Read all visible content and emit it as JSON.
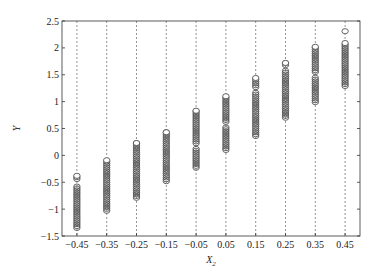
{
  "chart_data": {
    "type": "scatter",
    "title": "",
    "xlabel": "X",
    "xlabel_subscript": "2",
    "ylabel": "Y",
    "xlim": [
      -0.5,
      0.5
    ],
    "ylim": [
      -1.5,
      2.5
    ],
    "grid": "vertical dashed lines at each x category",
    "legend": "none",
    "marker": "open circle",
    "x_ticks": [
      "-0.45",
      "-0.35",
      "-0.25",
      "-0.15",
      "-0.05",
      "0.05",
      "0.15",
      "0.25",
      "0.35",
      "0.45"
    ],
    "y_ticks": [
      "-1.5",
      "-1",
      "-0.5",
      "0",
      "0.5",
      "1",
      "1.5",
      "2",
      "2.5"
    ],
    "columns": [
      {
        "x": -0.45,
        "y_min": -1.35,
        "y_max": -0.38,
        "gaps": [
          [
            -0.55,
            -0.45
          ]
        ]
      },
      {
        "x": -0.35,
        "y_min": -1.03,
        "y_max": -0.09,
        "gaps": []
      },
      {
        "x": -0.25,
        "y_min": -0.79,
        "y_max": 0.23,
        "gaps": []
      },
      {
        "x": -0.15,
        "y_min": -0.48,
        "y_max": 0.43,
        "gaps": []
      },
      {
        "x": -0.05,
        "y_min": -0.23,
        "y_max": 0.83,
        "gaps": [
          [
            0.15,
            0.22
          ]
        ]
      },
      {
        "x": 0.05,
        "y_min": 0.1,
        "y_max": 1.1,
        "gaps": [
          [
            0.55,
            0.62
          ]
        ]
      },
      {
        "x": 0.15,
        "y_min": 0.36,
        "y_max": 1.44,
        "gaps": [
          [
            1.2,
            1.27
          ]
        ]
      },
      {
        "x": 0.25,
        "y_min": 0.7,
        "y_max": 1.72,
        "gaps": [
          [
            1.58,
            1.65
          ]
        ]
      },
      {
        "x": 0.35,
        "y_min": 0.99,
        "y_max": 2.02,
        "gaps": [
          [
            1.45,
            1.52
          ]
        ]
      },
      {
        "x": 0.45,
        "y_min": 1.29,
        "y_max": 2.09,
        "outliers": [
          2.31
        ],
        "gaps": []
      }
    ]
  },
  "colors": {
    "marker": "#555555",
    "axis": "#333333",
    "grid": "#666666",
    "background": "#ffffff"
  }
}
